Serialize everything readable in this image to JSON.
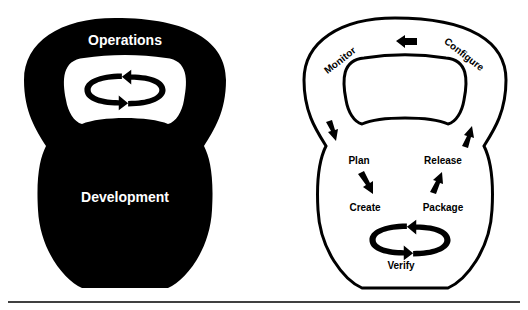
{
  "diagram": {
    "left_kettlebell": {
      "fill": "#000000",
      "top_label": "Operations",
      "bottom_label": "Development",
      "label_color": "#ffffff",
      "center_icon": "cycle-arrows-icon"
    },
    "right_kettlebell": {
      "fill": "#ffffff",
      "stroke": "#000000",
      "handle_labels": {
        "left": "Monitor",
        "right": "Configure"
      },
      "body_labels": {
        "plan": "Plan",
        "release": "Release",
        "create": "Create",
        "package": "Package",
        "verify": "Verify"
      },
      "arrows": [
        "arrow-left-icon",
        "arrow-down-icon",
        "arrow-up-icon",
        "arrow-plan-to-create-icon",
        "arrow-package-to-release-icon",
        "cycle-arrows-icon"
      ]
    },
    "divider_color": "#000000"
  }
}
